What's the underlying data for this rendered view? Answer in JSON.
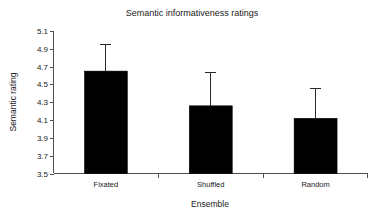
{
  "chart_data": {
    "type": "bar",
    "title": "Semantic informativeness ratings",
    "xlabel": "Ensemble",
    "ylabel": "Semantic rating",
    "categories": [
      "Fixated",
      "Shuffled",
      "Random"
    ],
    "values": [
      4.65,
      4.26,
      4.12
    ],
    "error_high": [
      4.95,
      4.63,
      4.45
    ],
    "error_low": [
      4.65,
      4.26,
      4.12
    ],
    "ylim": [
      3.5,
      5.1
    ],
    "ytick_labels": [
      "5.1",
      "4.9",
      "4.7",
      "4.5",
      "4.3",
      "4.1",
      "3.9",
      "3.7",
      "3.5"
    ],
    "ytick_values": [
      5.1,
      4.9,
      4.7,
      4.5,
      4.3,
      4.1,
      3.9,
      3.7,
      3.5
    ],
    "grid": false,
    "legend": "none",
    "bar_color": "#000000",
    "axis_color": "#4d4d4d",
    "error_bar_color": "#2b2b2b"
  }
}
